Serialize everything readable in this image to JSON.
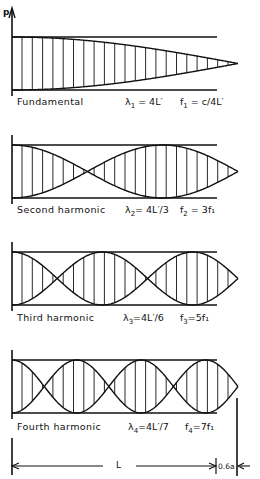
{
  "figure": {
    "axis_label": "p",
    "span_label": "L",
    "end_correction_label": "0.6a",
    "line_color": "#111111",
    "background": "#ffffff"
  },
  "panels": [
    {
      "name": "Fundamental",
      "quarter_waves": 1,
      "wavelength": {
        "symbol": "λ",
        "sub": "1",
        "rhs": "= 4L′"
      },
      "frequency": {
        "symbol": "f",
        "sub": "1",
        "rhs": "= c/4L′"
      }
    },
    {
      "name": "Second harmonic",
      "quarter_waves": 3,
      "wavelength": {
        "symbol": "λ",
        "sub": "2",
        "rhs": "= 4L′/3"
      },
      "frequency": {
        "symbol": "f",
        "sub": "2",
        "rhs": "= 3f₁"
      }
    },
    {
      "name": "Third harmonic",
      "quarter_waves": 5,
      "wavelength": {
        "symbol": "λ",
        "sub": "3",
        "rhs": "=4L′/6"
      },
      "frequency": {
        "symbol": "f",
        "sub": "3",
        "rhs": "=5f₁"
      }
    },
    {
      "name": "Fourth harmonic",
      "quarter_waves": 7,
      "wavelength": {
        "symbol": "λ",
        "sub": "4",
        "rhs": "=4L′/7"
      },
      "frequency": {
        "symbol": "f",
        "sub": "4",
        "rhs": "=7f₁"
      }
    }
  ]
}
